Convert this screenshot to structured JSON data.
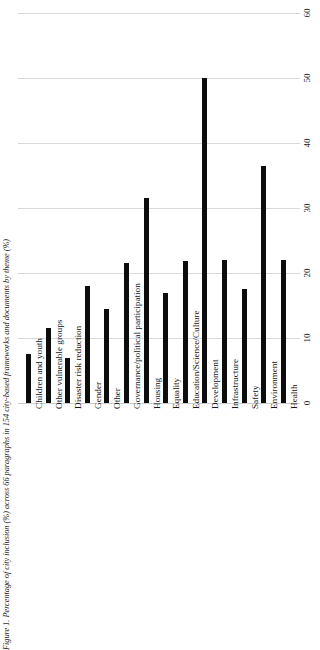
{
  "figure": {
    "caption": "Figure 1. Percentage of city inclusion (%) across 66 paragraphs in 154 city-based frameworks and documents by theme (%)"
  },
  "chart_data": {
    "type": "bar",
    "title": "",
    "xlabel": "",
    "ylabel": "",
    "orientation": "vertical-rotated",
    "grid": true,
    "legend": "none",
    "ylim": [
      0,
      60
    ],
    "yticks": [
      0,
      10,
      20,
      30,
      40,
      50,
      60
    ],
    "ytick_labels": [
      "0",
      "10",
      "20",
      "30",
      "40",
      "50",
      "60"
    ],
    "bar_color": "#0d0d0d",
    "grid_color": "#d9d9d9",
    "categories": [
      "Children and youth",
      "Other vulnerable groups",
      "Disaster risk reduction",
      "Gender",
      "Other",
      "Governance/political participation",
      "Housing",
      "Equality",
      "Education/Science/Culture",
      "Development",
      "Infrastructure",
      "Safety",
      "Environment",
      "Health"
    ],
    "values": [
      7.5,
      11.5,
      7,
      18,
      14.5,
      21.5,
      31.5,
      17,
      21.8,
      50,
      22,
      17.5,
      36.5,
      22
    ]
  }
}
